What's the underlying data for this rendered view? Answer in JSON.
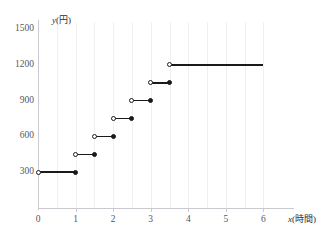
{
  "chart_data": {
    "type": "line",
    "subtype": "step",
    "title": "",
    "xlabel": "x(時間)",
    "ylabel": "y(円)",
    "xlim": [
      0,
      6.6
    ],
    "ylim": [
      0,
      1560
    ],
    "grid": "vertical-only",
    "legend": "none",
    "x_ticks": [
      "0",
      "1",
      "2",
      "3",
      "4",
      "5",
      "6"
    ],
    "x_tick_values": [
      0,
      1,
      2,
      3,
      4,
      5,
      6
    ],
    "y_ticks": [
      "300",
      "600",
      "900",
      "1200",
      "1500"
    ],
    "y_tick_values": [
      300,
      600,
      900,
      1200,
      1500
    ],
    "segments": [
      {
        "x_start": 0,
        "x_end": 1,
        "y": 300,
        "left_endpoint": "open",
        "right_endpoint": "closed"
      },
      {
        "x_start": 1,
        "x_end": 1.5,
        "y": 450,
        "left_endpoint": "open",
        "right_endpoint": "closed"
      },
      {
        "x_start": 1.5,
        "x_end": 2,
        "y": 600,
        "left_endpoint": "open",
        "right_endpoint": "closed"
      },
      {
        "x_start": 2,
        "x_end": 2.5,
        "y": 750,
        "left_endpoint": "open",
        "right_endpoint": "closed"
      },
      {
        "x_start": 2.5,
        "x_end": 3,
        "y": 900,
        "left_endpoint": "open",
        "right_endpoint": "closed"
      },
      {
        "x_start": 3,
        "x_end": 3.5,
        "y": 1050,
        "left_endpoint": "open",
        "right_endpoint": "closed"
      },
      {
        "x_start": 3.5,
        "x_end": 6,
        "y": 1200,
        "left_endpoint": "open",
        "right_endpoint": "none"
      }
    ],
    "gridline_x_values": [
      0.5,
      1,
      1.5,
      2,
      2.5,
      3,
      3.5,
      4,
      4.5,
      5,
      5.5,
      6
    ],
    "colors": {
      "line": "#1a1a1a",
      "grid": "#f0f0f2",
      "axis": "#c9c9cf",
      "tick_label": "#56565c",
      "background": "#ffffff"
    }
  }
}
